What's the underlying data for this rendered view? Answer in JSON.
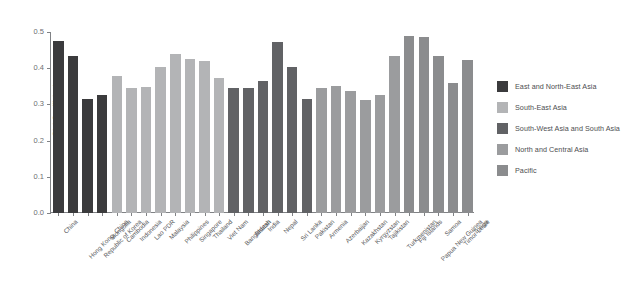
{
  "chart_data": {
    "type": "bar",
    "title": "",
    "xlabel": "",
    "ylabel": "Gini Coefficient",
    "ylim": [
      0.0,
      0.5
    ],
    "ytick_labels": [
      "0.5",
      "0.4",
      "0.3",
      "0.2",
      "0.1",
      "0.0"
    ],
    "ytick_values": [
      0.5,
      0.4,
      0.3,
      0.2,
      0.1,
      0.0
    ],
    "grid": false,
    "legend_position": "right",
    "categories": [
      "China",
      "Hong Kong, China",
      "Republic of Korea",
      "Mongolia",
      "Cambodia",
      "Indonesia",
      "Lao PDR",
      "Malaysia",
      "Philippines",
      "Singapore",
      "Thailand",
      "Viet Nam",
      "Bangladesh",
      "Bhutan",
      "India",
      "Nepal",
      "Sri Lanka",
      "Pakistan",
      "Armenia",
      "Azerbaijan",
      "Kazakhstan",
      "Kyrgyzstan",
      "Tajikistan",
      "Turkmenistan",
      "Fiji Islands",
      "Papua New Guinea",
      "Samoa",
      "Timor-Leste",
      "Tonga"
    ],
    "values": [
      0.474,
      0.434,
      0.315,
      0.327,
      0.379,
      0.345,
      0.349,
      0.404,
      0.44,
      0.425,
      0.42,
      0.373,
      0.345,
      0.345,
      0.364,
      0.473,
      0.403,
      0.315,
      0.345,
      0.35,
      0.337,
      0.311,
      0.326,
      0.435,
      0.489,
      0.486,
      0.433,
      0.36,
      0.424
    ],
    "groups": [
      {
        "name": "East and North-East Asia",
        "color": "#3b3b3d",
        "count": 4
      },
      {
        "name": "South-East Asia",
        "color": "#b3b4b6",
        "count": 8
      },
      {
        "name": "South-West Asia and South Asia",
        "color": "#616265",
        "count": 6
      },
      {
        "name": "North and Central Asia",
        "color": "#9b9c9e",
        "count": 6
      },
      {
        "name": "Pacific",
        "color": "#8b8c8e",
        "count": 5
      }
    ]
  },
  "legend": {
    "items": [
      {
        "label": "East and North-East Asia",
        "color": "#3b3b3d"
      },
      {
        "label": "South-East Asia",
        "color": "#b3b4b6"
      },
      {
        "label": "South-West Asia and South Asia",
        "color": "#616265"
      },
      {
        "label": "North and Central Asia",
        "color": "#9b9c9e"
      },
      {
        "label": "Pacific",
        "color": "#8b8c8e"
      }
    ]
  }
}
